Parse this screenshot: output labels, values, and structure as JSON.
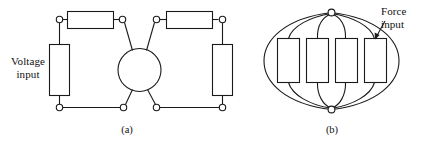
{
  "figure": {
    "width": 431,
    "height": 146,
    "background_color": "#ffffff",
    "line_color": "#1a1a1a"
  },
  "panels": [
    {
      "id": "a",
      "caption": "(a)",
      "description": "Wheatstone bridge: four rectangular strain-gauge resistors around a central circle",
      "labels": [
        {
          "name": "voltage-input",
          "text": "Voltage\ninput"
        }
      ],
      "resistor_count": 4,
      "node_count": 6,
      "center_element": "circle"
    },
    {
      "id": "b",
      "caption": "(b)",
      "description": "Four strain gauges arranged on a circular diaphragm between a top and bottom node",
      "labels": [
        {
          "name": "force-input",
          "text": "Force\ninput"
        }
      ],
      "resistor_count": 4,
      "node_count": 2,
      "arrow": {
        "name": "force-input-arrow",
        "points_to": "rightmost-gauge"
      }
    }
  ]
}
